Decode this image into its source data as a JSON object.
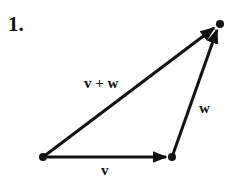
{
  "problem_number": "1.",
  "labels": {
    "sum": "v + w",
    "v": "v",
    "w": "w"
  },
  "points": {
    "origin": [
      43,
      157
    ],
    "v_end": [
      172,
      157
    ],
    "tip": [
      220,
      24
    ]
  },
  "colors": {
    "ink": "#111111",
    "background": "#ffffff"
  }
}
